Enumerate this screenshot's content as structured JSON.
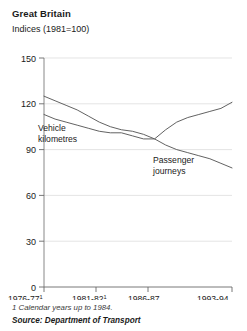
{
  "header": {
    "title": "Great Britain",
    "subtitle": "Indices (1981=100)"
  },
  "footer": {
    "footnote": "1 Calendar years up to 1984.",
    "source": "Source: Department of Transport"
  },
  "chart_data": {
    "type": "line",
    "title": "Great Britain",
    "subtitle": "Indices (1981=100)",
    "xlabel": "",
    "ylabel": "",
    "ylim": [
      0,
      150
    ],
    "yticks": [
      0,
      30,
      60,
      90,
      120,
      150
    ],
    "ytick_labels": [
      "0",
      "30",
      "60",
      "90",
      "120",
      "150"
    ],
    "grid": true,
    "legend": "inline-annotations",
    "xtick_labels": [
      "1976-77",
      "1981-82",
      "1986-87",
      "1993-94"
    ],
    "xtick_footnote_marks": [
      "1",
      "1",
      "",
      ""
    ],
    "x": [
      "1976-77",
      "1977-78",
      "1978-79",
      "1979-80",
      "1980-81",
      "1981-82",
      "1982-83",
      "1983-84",
      "1984-85",
      "1985-86",
      "1986-87",
      "1987-88",
      "1988-89",
      "1989-90",
      "1990-91",
      "1991-92",
      "1992-93",
      "1993-94"
    ],
    "series": [
      {
        "name": "Passenger journeys",
        "color": "#5a5a5a",
        "values": [
          125,
          122,
          119,
          116,
          112,
          108,
          105,
          103,
          102,
          100,
          97,
          93,
          90,
          88,
          86,
          84,
          81,
          78
        ]
      },
      {
        "name": "Vehicle kilometres",
        "color": "#5a5a5a",
        "values": [
          113,
          110,
          108,
          106,
          104,
          102,
          101,
          101,
          99,
          97,
          97,
          103,
          108,
          111,
          113,
          115,
          117,
          121
        ]
      }
    ],
    "annotations": [
      {
        "text_line1": "Vehicle",
        "text_line2": "kilometres",
        "x": 38,
        "y": 128
      },
      {
        "text_line1": "Passenger",
        "text_line2": "journeys",
        "x": 153,
        "y": 160
      }
    ]
  }
}
